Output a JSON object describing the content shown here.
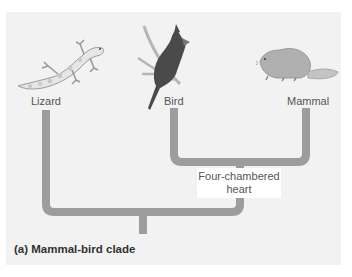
{
  "figure": {
    "caption": "(a) Mammal-bird clade",
    "taxa": [
      {
        "label": "Lizard",
        "icon": "lizard-icon"
      },
      {
        "label": "Bird",
        "icon": "bird-icon"
      },
      {
        "label": "Mammal",
        "icon": "mammal-icon"
      }
    ],
    "shared_character": {
      "line1": "Four-chambered",
      "line2": "heart"
    },
    "colors": {
      "panel": "#f2f2f2",
      "branch": "#9d9d9d",
      "label_box": "#ffffff",
      "text": "#555555"
    }
  }
}
